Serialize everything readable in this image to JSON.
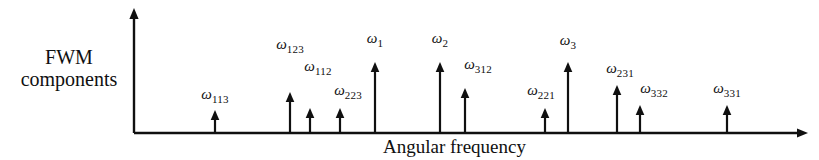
{
  "figure": {
    "background_color": "#ffffff",
    "ink_color": "#101010",
    "y_axis_label": "FWM\ncomponents",
    "x_axis_label": "Angular frequency"
  },
  "axes": {
    "origin_x": 134,
    "origin_y": 133,
    "x_end": 808,
    "y_top": 8
  },
  "chart_data": {
    "type": "bar",
    "title": "",
    "xlabel": "Angular frequency",
    "ylabel": "FWM components",
    "grid": false,
    "legend": null,
    "categories": [
      "ω113",
      "ω123",
      "ω112",
      "ω223",
      "ω1",
      "ω2",
      "ω312",
      "ω221",
      "ω3",
      "ω231",
      "ω332",
      "ω331"
    ],
    "values": [
      23,
      41,
      25,
      25,
      71,
      71,
      45,
      25,
      71,
      48,
      28,
      28
    ],
    "x": [
      215,
      290,
      310,
      340,
      375,
      440,
      465,
      545,
      568,
      617,
      640,
      727
    ],
    "ylim": [
      0,
      125
    ],
    "peaks": [
      {
        "base": "ω",
        "sub": "113",
        "x": 215,
        "tip_y": 110,
        "label_x": 215,
        "label_y": 86
      },
      {
        "base": "ω",
        "sub": "123",
        "x": 290,
        "tip_y": 92,
        "label_x": 290,
        "label_y": 36
      },
      {
        "base": "ω",
        "sub": "112",
        "x": 310,
        "tip_y": 108,
        "label_x": 318,
        "label_y": 58
      },
      {
        "base": "ω",
        "sub": "223",
        "x": 340,
        "tip_y": 108,
        "label_x": 348,
        "label_y": 82
      },
      {
        "base": "ω",
        "sub": "1",
        "x": 375,
        "tip_y": 62,
        "label_x": 375,
        "label_y": 30
      },
      {
        "base": "ω",
        "sub": "2",
        "x": 440,
        "tip_y": 62,
        "label_x": 440,
        "label_y": 30
      },
      {
        "base": "ω",
        "sub": "312",
        "x": 465,
        "tip_y": 88,
        "label_x": 478,
        "label_y": 56
      },
      {
        "base": "ω",
        "sub": "221",
        "x": 545,
        "tip_y": 108,
        "label_x": 541,
        "label_y": 82
      },
      {
        "base": "ω",
        "sub": "3",
        "x": 568,
        "tip_y": 62,
        "label_x": 568,
        "label_y": 32
      },
      {
        "base": "ω",
        "sub": "231",
        "x": 617,
        "tip_y": 85,
        "label_x": 620,
        "label_y": 60
      },
      {
        "base": "ω",
        "sub": "332",
        "x": 640,
        "tip_y": 105,
        "label_x": 654,
        "label_y": 80
      },
      {
        "base": "ω",
        "sub": "331",
        "x": 727,
        "tip_y": 105,
        "label_x": 727,
        "label_y": 80
      }
    ]
  }
}
